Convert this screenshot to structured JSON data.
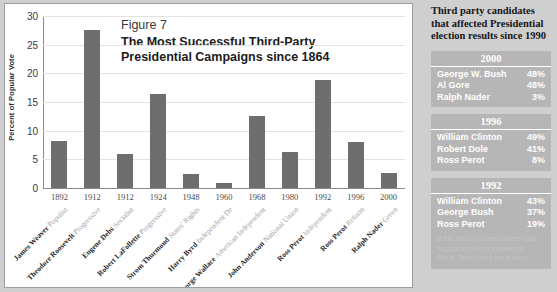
{
  "chart_data": {
    "type": "bar",
    "figure_number": "Figure 7",
    "title_line1": "The Most Successful Third-Party",
    "title_line2": "Presidential Campaigns since 1864",
    "ylabel": "Percent of Popular Vote",
    "xlabel": "",
    "ylim": [
      0,
      30
    ],
    "yticks": [
      "0",
      "5",
      "10",
      "15",
      "20",
      "25",
      "30"
    ],
    "grid": true,
    "legend": "none",
    "bar_color": "#6e6e6e",
    "categories": [
      "1892",
      "1912",
      "1912",
      "1924",
      "1948",
      "1960",
      "1968",
      "1980",
      "1992",
      "1996",
      "2000"
    ],
    "values": [
      8.2,
      27.5,
      6.0,
      16.4,
      2.4,
      0.8,
      12.5,
      6.3,
      18.9,
      8.1,
      2.7
    ],
    "candidates": [
      {
        "year": "1892",
        "name": "James Weaver",
        "party": "Populist",
        "value": 8.2
      },
      {
        "year": "1912",
        "name": "Theodore Roosevelt",
        "party": "Progressive",
        "value": 27.5
      },
      {
        "year": "1912",
        "name": "Eugene Debs",
        "party": "Socialist",
        "value": 6.0
      },
      {
        "year": "1924",
        "name": "Robert LaFollette",
        "party": "Progressive",
        "value": 16.4
      },
      {
        "year": "1948",
        "name": "Strom Thurmond",
        "party": "States' Rights",
        "value": 2.4
      },
      {
        "year": "1960",
        "name": "Harry Byrd",
        "party": "Independent De",
        "value": 0.8
      },
      {
        "year": "1968",
        "name": "George Wallace",
        "party": "American Independent",
        "value": 12.5
      },
      {
        "year": "1980",
        "name": "John Anderson",
        "party": "National Union",
        "value": 6.3
      },
      {
        "year": "1992",
        "name": "Ross Perot",
        "party": "Independent",
        "value": 18.9
      },
      {
        "year": "1996",
        "name": "Ross Perot",
        "party": "Reform",
        "value": 8.1
      },
      {
        "year": "2000",
        "name": "Ralph Nader",
        "party": "Green",
        "value": 2.7
      }
    ]
  },
  "sidebar": {
    "heading": "Third party candidates that affected Presidential election results since 1990",
    "blocks": [
      {
        "year": "2000",
        "rows": [
          {
            "name": "George W. Bush",
            "pct": "48%"
          },
          {
            "name": "Al Gore",
            "pct": "48%"
          },
          {
            "name": "Ralph Nader",
            "pct": "3%"
          }
        ],
        "note": ""
      },
      {
        "year": "1996",
        "rows": [
          {
            "name": "William Clinton",
            "pct": "49%"
          },
          {
            "name": "Robert Dole",
            "pct": "41%"
          },
          {
            "name": "Ross Perot",
            "pct": "8%"
          }
        ],
        "note": ""
      },
      {
        "year": "1992",
        "rows": [
          {
            "name": "William Clinton",
            "pct": "43%"
          },
          {
            "name": "George Bush",
            "pct": "37%"
          },
          {
            "name": "Ross Perot",
            "pct": "19%"
          }
        ],
        "note": "If the fiscal conservatives had supported Bush instead of Perot, Bush may have won."
      }
    ]
  }
}
